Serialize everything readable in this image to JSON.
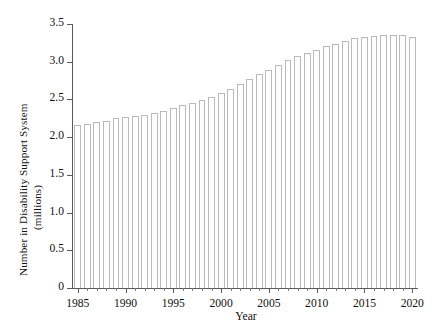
{
  "chart_data": {
    "type": "bar",
    "title": "",
    "subtitle": "",
    "xlabel": "Year",
    "ylabel": "Number in Disability Support System",
    "ylabel_units": "(millions)",
    "ylim": [
      0,
      3.5
    ],
    "xlim": [
      1984.4,
      2020.6
    ],
    "grid": false,
    "legend": null,
    "y_ticks": [
      0,
      0.5,
      1.0,
      1.5,
      2.0,
      2.5,
      3.0,
      3.5
    ],
    "y_tick_labels": [
      "0",
      "0.5",
      "1.0",
      "1.5",
      "2.0",
      "2.5",
      "3.0",
      "3.5"
    ],
    "x_major_ticks": [
      1985,
      1990,
      1995,
      2000,
      2005,
      2010,
      2015,
      2020
    ],
    "x_major_tick_labels": [
      "1985",
      "1990",
      "1995",
      "2000",
      "2005",
      "2010",
      "2015",
      "2020"
    ],
    "x_minor_tick_step": 1,
    "bar_edge_color": "#b9b9b9",
    "bar_fill_color": "#ffffff",
    "axis_color": "#5a5a5a",
    "background_color": "#ffffff",
    "categories": [
      "1985",
      "1986",
      "1987",
      "1988",
      "1989",
      "1990",
      "1991",
      "1992",
      "1993",
      "1994",
      "1995",
      "1996",
      "1997",
      "1998",
      "1999",
      "2000",
      "2001",
      "2002",
      "2003",
      "2004",
      "2005",
      "2006",
      "2007",
      "2008",
      "2009",
      "2010",
      "2011",
      "2012",
      "2013",
      "2014",
      "2015",
      "2016",
      "2017",
      "2018",
      "2019",
      "2020"
    ],
    "values": [
      2.16,
      2.17,
      2.2,
      2.22,
      2.25,
      2.27,
      2.28,
      2.3,
      2.32,
      2.35,
      2.38,
      2.42,
      2.45,
      2.49,
      2.53,
      2.58,
      2.64,
      2.71,
      2.77,
      2.84,
      2.89,
      2.96,
      3.02,
      3.07,
      3.11,
      3.16,
      3.21,
      3.24,
      3.28,
      3.31,
      3.33,
      3.34,
      3.35,
      3.35,
      3.35,
      3.33
    ]
  }
}
